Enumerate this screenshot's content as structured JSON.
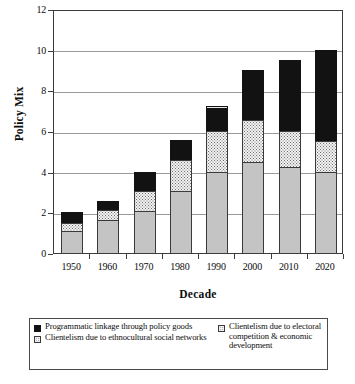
{
  "chart_data": {
    "type": "bar",
    "stacked": true,
    "title": "",
    "xlabel": "Decade",
    "ylabel": "Policy Mix",
    "ylim": [
      0,
      12
    ],
    "yticks": [
      0,
      2,
      4,
      6,
      8,
      10,
      12
    ],
    "grid": "horizontal",
    "legend_position": "bottom",
    "categories": [
      "1950",
      "1960",
      "1970",
      "1980",
      "1990",
      "2000",
      "2010",
      "2020"
    ],
    "series": [
      {
        "name": "Clientelism due to ethnocultural social networks",
        "style": "light-gray",
        "color": "#c4c4c4",
        "values": [
          1.1,
          1.6,
          2.05,
          3.05,
          4.0,
          4.5,
          4.25,
          4.0
        ]
      },
      {
        "name": "Clientelism due to electoral competition & economic development",
        "style": "dotted",
        "color": "#f2f2f2",
        "values": [
          0.4,
          0.5,
          1.0,
          1.5,
          2.0,
          2.05,
          1.75,
          1.5
        ]
      },
      {
        "name": "Programmatic linkage through policy goods",
        "style": "black",
        "color": "#121212",
        "values": [
          0.5,
          0.45,
          0.95,
          1.0,
          1.25,
          2.45,
          3.5,
          4.5
        ]
      }
    ],
    "totals": [
      2.0,
      2.55,
      4.0,
      5.55,
      7.25,
      9.0,
      9.5,
      10.0
    ]
  },
  "axes": {
    "y_title": "Policy Mix",
    "x_title": "Decade",
    "y_tick_labels": [
      "0",
      "2",
      "4",
      "6",
      "8",
      "10",
      "12"
    ],
    "x_tick_labels": [
      "1950",
      "1960",
      "1970",
      "1980",
      "1990",
      "2000",
      "2010",
      "2020"
    ]
  },
  "legend": {
    "entries": [
      {
        "label": "Programmatic linkage through policy goods",
        "swatch": "black-square-icon"
      },
      {
        "label": "Clientelism due to ethnocultural social networks",
        "swatch": "dotted-square-icon"
      },
      {
        "label": "Clientelism due to electoral competition & economic development",
        "swatch": "dotted-square-icon"
      }
    ]
  }
}
